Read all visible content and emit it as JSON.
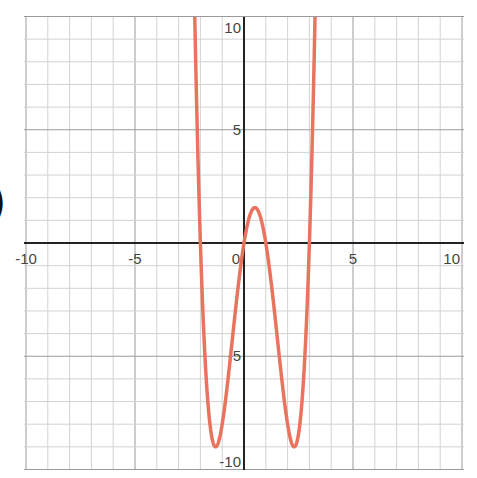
{
  "chart_data": {
    "type": "line",
    "title": "",
    "xlabel": "",
    "ylabel": "",
    "xlim": [
      -10,
      10
    ],
    "ylim": [
      -10,
      10
    ],
    "grid": true,
    "grid_step": 1,
    "x_ticks": [
      -10,
      -5,
      0,
      5,
      10
    ],
    "y_ticks": [
      10,
      5,
      -5,
      -10
    ],
    "x_tick_labels": [
      "-10",
      "-5",
      "0",
      "5",
      "10"
    ],
    "y_tick_labels": [
      "10",
      "5",
      "-5",
      "-10"
    ],
    "series": [
      {
        "name": "f(x)",
        "color": "#e8735f",
        "description": "quartic with roots at -2, 0, 1, 3",
        "roots": [
          -2,
          0,
          1,
          3
        ],
        "local_max": {
          "x": 0.5,
          "y": 1.56
        },
        "local_min": [
          {
            "x": -1.3,
            "y": -9.0
          },
          {
            "x": 2.3,
            "y": -9.0
          }
        ],
        "x": [
          -2.3,
          -2.0,
          -1.5,
          -1.3,
          -1.0,
          -0.5,
          0,
          0.5,
          1.0,
          1.5,
          2.0,
          2.3,
          2.5,
          3.0,
          3.3
        ],
        "y": [
          12.6,
          0,
          -7.9,
          -9.0,
          -8.0,
          -3.9,
          0,
          1.56,
          0,
          -4.7,
          -8.0,
          -9.0,
          -8.4,
          0,
          13.1
        ]
      }
    ]
  },
  "decor": {
    "left_glyph": ")"
  }
}
